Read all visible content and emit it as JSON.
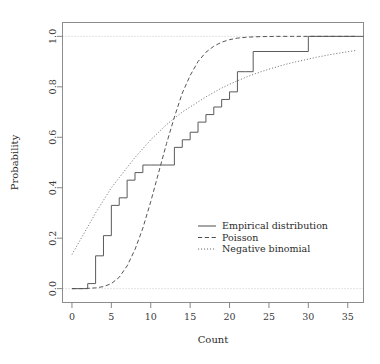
{
  "chart_data": {
    "type": "line",
    "title": "",
    "subtitle": "",
    "xlabel": "Count",
    "ylabel": "Probability",
    "xlim": [
      -1.2,
      37.0
    ],
    "ylim": [
      -0.055,
      1.055
    ],
    "grid": false,
    "reference_lines": [
      {
        "name": "upper-bound",
        "y": 1.0,
        "style": "dotted",
        "color": "#bfbfbf"
      },
      {
        "name": "lower-bound",
        "y": 0.0,
        "style": "dotted",
        "color": "#bfbfbf"
      }
    ],
    "xticks": [
      0,
      5,
      10,
      15,
      20,
      25,
      30,
      35
    ],
    "xtick_labels": [
      "0",
      "5",
      "10",
      "15",
      "20",
      "25",
      "30",
      "35"
    ],
    "yticks": [
      0.0,
      0.2,
      0.4,
      0.6,
      0.8,
      1.0
    ],
    "ytick_labels": [
      "0.0",
      "0.2",
      "0.4",
      "0.6",
      "0.8",
      "1.0"
    ],
    "legend": {
      "position": "center-right",
      "entries": [
        {
          "label": "Empirical distribution",
          "style": "solid",
          "color": "#4d4d4d"
        },
        {
          "label": "Poisson",
          "style": "dashed",
          "color": "#4d4d4d"
        },
        {
          "label": "Negative binomial",
          "style": "dotted",
          "color": "#6b6b6b"
        }
      ]
    },
    "series": [
      {
        "name": "Empirical distribution",
        "style": "solid",
        "color": "#5a5a5a",
        "type": "step",
        "x": [
          0,
          1,
          2,
          3,
          4,
          5,
          6,
          7,
          8,
          9,
          10,
          11,
          12,
          13,
          14,
          15,
          16,
          17,
          18,
          19,
          20,
          21,
          22,
          23,
          30,
          36
        ],
        "y": [
          0.0,
          0.0,
          0.02,
          0.13,
          0.21,
          0.33,
          0.36,
          0.43,
          0.46,
          0.49,
          0.49,
          0.49,
          0.49,
          0.56,
          0.59,
          0.62,
          0.66,
          0.69,
          0.72,
          0.75,
          0.78,
          0.86,
          0.86,
          0.94,
          1.0,
          1.0
        ]
      },
      {
        "name": "Poisson",
        "style": "dashed",
        "color": "#555555",
        "type": "curve",
        "x": [
          0,
          1,
          2,
          3,
          4,
          5,
          6,
          7,
          8,
          9,
          10,
          11,
          12,
          13,
          14,
          15,
          16,
          17,
          18,
          19,
          20,
          21,
          22,
          23,
          24,
          26,
          28,
          30,
          32,
          34,
          36
        ],
        "y": [
          0.0,
          0.0,
          0.001,
          0.003,
          0.008,
          0.02,
          0.045,
          0.09,
          0.155,
          0.24,
          0.345,
          0.46,
          0.575,
          0.68,
          0.775,
          0.845,
          0.9,
          0.937,
          0.961,
          0.977,
          0.987,
          0.993,
          0.996,
          0.998,
          0.999,
          1.0,
          1.0,
          1.0,
          1.0,
          1.0,
          1.0
        ]
      },
      {
        "name": "Negative binomial",
        "style": "dotted",
        "color": "#787878",
        "type": "curve",
        "x": [
          0,
          1,
          2,
          3,
          4,
          5,
          6,
          7,
          8,
          9,
          10,
          11,
          12,
          13,
          14,
          15,
          16,
          17,
          18,
          19,
          20,
          21,
          22,
          23,
          24,
          25,
          26,
          27,
          28,
          29,
          30,
          31,
          32,
          33,
          34,
          35,
          36
        ],
        "y": [
          0.135,
          0.19,
          0.245,
          0.3,
          0.35,
          0.4,
          0.44,
          0.48,
          0.52,
          0.555,
          0.59,
          0.62,
          0.65,
          0.675,
          0.7,
          0.72,
          0.74,
          0.76,
          0.778,
          0.795,
          0.81,
          0.824,
          0.837,
          0.849,
          0.86,
          0.87,
          0.879,
          0.888,
          0.896,
          0.903,
          0.91,
          0.917,
          0.923,
          0.929,
          0.934,
          0.939,
          0.944
        ]
      }
    ]
  }
}
